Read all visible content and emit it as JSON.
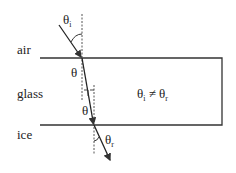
{
  "labels": {
    "air": "air",
    "glass": "glass",
    "ice": "ice",
    "theta_i": "θ",
    "theta_i_sub": "i",
    "theta_glass_top": "θ",
    "theta_glass_bottom": "θ",
    "theta_r": "θ",
    "theta_r_sub": "r",
    "relation_left": "θ",
    "relation_left_sub": "i",
    "relation_sign": "≠",
    "relation_right": "θ",
    "relation_right_sub": "r"
  },
  "colors": {
    "line": "#333333",
    "background": "#ffffff"
  }
}
